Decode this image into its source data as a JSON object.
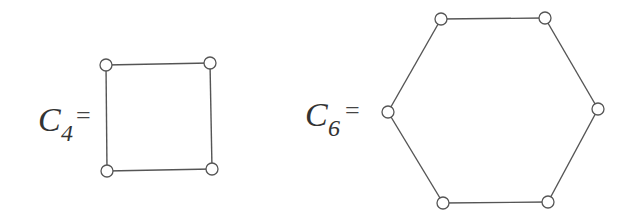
{
  "graphs": [
    {
      "name": "C4",
      "label_main": "C",
      "label_sub": "4",
      "equals": "=",
      "vertices": [
        [
          106,
          65
        ],
        [
          210,
          63
        ],
        [
          212,
          169
        ],
        [
          107,
          171
        ]
      ]
    },
    {
      "name": "C6",
      "label_main": "C",
      "label_sub": "6",
      "equals": "=",
      "vertices": [
        [
          441,
          19
        ],
        [
          545,
          18
        ],
        [
          598,
          109
        ],
        [
          548,
          202
        ],
        [
          443,
          203
        ],
        [
          388,
          112
        ]
      ]
    }
  ],
  "colors": {
    "stroke": "#555555",
    "vertex_fill": "#ffffff",
    "text": "#333333"
  },
  "vertex_radius": 6
}
